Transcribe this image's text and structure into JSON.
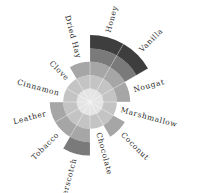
{
  "chart_data": {
    "type": "polar-bar",
    "title": "",
    "center": [
      90,
      102
    ],
    "ring_step_px": 13.4,
    "max_level": 5,
    "start_angle_deg": 60,
    "categories": [
      "Honey",
      "Dried Hay",
      "Clove",
      "Cinnamon",
      "Leather",
      "Tobacco",
      "Butterscotch",
      "Chocolate",
      "Coconut",
      "Marshmallow",
      "Nougat",
      "Vanilla"
    ],
    "values": [
      5,
      3,
      2,
      2,
      3,
      3,
      4,
      2,
      3,
      2,
      3,
      5
    ],
    "level_colors": [
      "#e4e4e4",
      "#c4c4c4",
      "#a6a6a6",
      "#7a7a7a",
      "#3e3e3e"
    ],
    "grid": true,
    "legend": "none"
  }
}
